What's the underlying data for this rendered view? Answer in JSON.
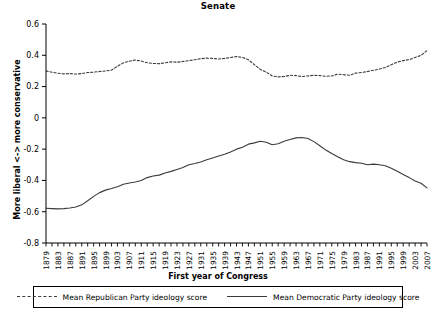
{
  "chart_data": {
    "type": "line",
    "title": "Senate",
    "xlabel": "First year of Congress",
    "ylabel": "More liberal <-> more conservative",
    "ylim": [
      -0.8,
      0.6
    ],
    "ytick_labels": [
      "0.6",
      "0.4",
      "0.2",
      "0",
      "-0.2",
      "-0.4",
      "-0.6",
      "-0.8"
    ],
    "ytick_values": [
      0.6,
      0.4,
      0.2,
      0,
      -0.2,
      -0.4,
      -0.6,
      -0.8
    ],
    "xlim": [
      1879,
      2007
    ],
    "grid": false,
    "legend_position": "bottom",
    "categories": [
      1879,
      1881,
      1883,
      1885,
      1887,
      1889,
      1891,
      1893,
      1895,
      1897,
      1899,
      1901,
      1903,
      1905,
      1907,
      1909,
      1911,
      1913,
      1915,
      1917,
      1919,
      1921,
      1923,
      1925,
      1927,
      1929,
      1931,
      1933,
      1935,
      1937,
      1939,
      1941,
      1943,
      1945,
      1947,
      1949,
      1951,
      1953,
      1955,
      1957,
      1959,
      1961,
      1963,
      1965,
      1967,
      1969,
      1971,
      1973,
      1975,
      1977,
      1979,
      1981,
      1983,
      1985,
      1987,
      1989,
      1991,
      1993,
      1995,
      1997,
      1999,
      2001,
      2003,
      2005,
      2007
    ],
    "xtick_labels": [
      "1879",
      "1883",
      "1887",
      "1891",
      "1895",
      "1899",
      "1903",
      "1907",
      "1911",
      "1915",
      "1919",
      "1923",
      "1927",
      "1931",
      "1935",
      "1939",
      "1943",
      "1947",
      "1951",
      "1955",
      "1959",
      "1963",
      "1967",
      "1971",
      "1975",
      "1979",
      "1983",
      "1987",
      "1991",
      "1995",
      "1999",
      "2003",
      "2007"
    ],
    "series": [
      {
        "name": "Mean Republican Party ideology score",
        "style": "dashed",
        "color": "#3a3a3a",
        "values": [
          0.3,
          0.292,
          0.285,
          0.281,
          0.283,
          0.28,
          0.283,
          0.29,
          0.292,
          0.296,
          0.3,
          0.305,
          0.33,
          0.352,
          0.362,
          0.37,
          0.363,
          0.352,
          0.348,
          0.346,
          0.352,
          0.358,
          0.356,
          0.36,
          0.366,
          0.372,
          0.378,
          0.382,
          0.38,
          0.376,
          0.38,
          0.386,
          0.392,
          0.386,
          0.372,
          0.34,
          0.31,
          0.292,
          0.268,
          0.262,
          0.264,
          0.272,
          0.27,
          0.264,
          0.268,
          0.272,
          0.27,
          0.266,
          0.268,
          0.28,
          0.276,
          0.272,
          0.286,
          0.29,
          0.296,
          0.304,
          0.312,
          0.322,
          0.34,
          0.356,
          0.366,
          0.372,
          0.386,
          0.4,
          0.43
        ]
      },
      {
        "name": "Mean Democratic Party ideology score",
        "style": "solid",
        "color": "#3a3a3a",
        "values": [
          -0.578,
          -0.58,
          -0.582,
          -0.58,
          -0.576,
          -0.57,
          -0.556,
          -0.53,
          -0.502,
          -0.478,
          -0.462,
          -0.452,
          -0.44,
          -0.424,
          -0.416,
          -0.41,
          -0.4,
          -0.382,
          -0.372,
          -0.366,
          -0.352,
          -0.342,
          -0.33,
          -0.318,
          -0.3,
          -0.292,
          -0.282,
          -0.268,
          -0.256,
          -0.244,
          -0.232,
          -0.218,
          -0.2,
          -0.188,
          -0.168,
          -0.16,
          -0.15,
          -0.156,
          -0.172,
          -0.166,
          -0.15,
          -0.138,
          -0.128,
          -0.126,
          -0.132,
          -0.152,
          -0.178,
          -0.206,
          -0.228,
          -0.248,
          -0.268,
          -0.28,
          -0.286,
          -0.29,
          -0.3,
          -0.296,
          -0.3,
          -0.306,
          -0.322,
          -0.342,
          -0.362,
          -0.382,
          -0.404,
          -0.418,
          -0.448
        ]
      }
    ]
  },
  "legend": {
    "entries": [
      {
        "label": "Mean Republican Party ideology score",
        "style": "dashed"
      },
      {
        "label": "Mean Democratic Party ideology score",
        "style": "solid"
      }
    ]
  }
}
